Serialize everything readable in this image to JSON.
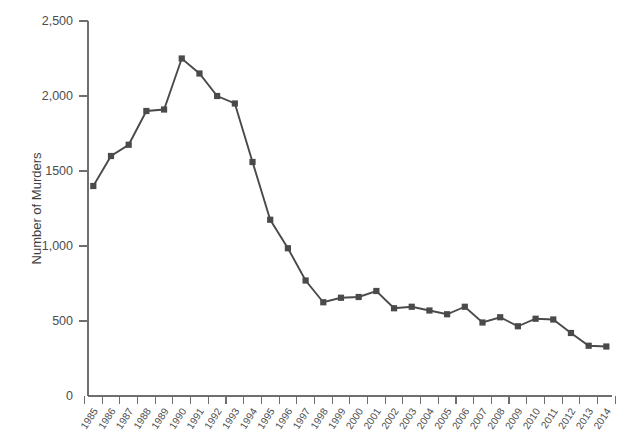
{
  "chart_data": {
    "type": "line",
    "title": "",
    "xlabel": "",
    "ylabel": "Number of Murders",
    "ylim": [
      0,
      2500
    ],
    "yticks": [
      0,
      500,
      1000,
      1500,
      2000,
      2500
    ],
    "ytick_labels": [
      "0",
      "500",
      "1,000",
      "1500",
      "2,000",
      "2,500"
    ],
    "grid": false,
    "legend": "none",
    "marker": "square",
    "line_color": "#4a4a4a",
    "marker_color": "#4a4a4a",
    "axis_color": "#6e6e6e",
    "categories": [
      "1985",
      "1986",
      "1987",
      "1988",
      "1989",
      "1990",
      "1991",
      "1992",
      "1993",
      "1994",
      "1995",
      "1996",
      "1997",
      "1998",
      "1999",
      "2000",
      "2001",
      "2002",
      "2003",
      "2004",
      "2005",
      "2006",
      "2007",
      "2008",
      "2009",
      "2010",
      "2011",
      "2012",
      "2013",
      "2014"
    ],
    "values": [
      1400,
      1600,
      1675,
      1900,
      1910,
      2250,
      2150,
      2000,
      1950,
      1560,
      1175,
      985,
      770,
      625,
      655,
      660,
      700,
      585,
      595,
      570,
      545,
      595,
      490,
      525,
      465,
      515,
      510,
      420,
      335,
      330
    ]
  }
}
